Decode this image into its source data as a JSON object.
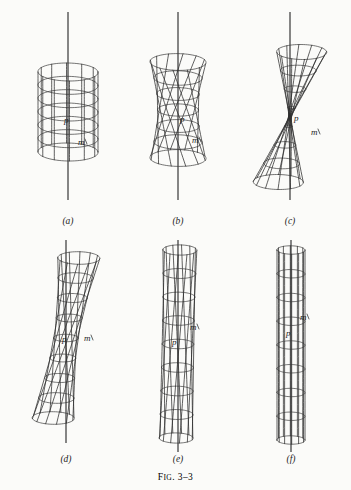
{
  "figure": {
    "caption_prefix": "F",
    "caption_smallcaps": "IG",
    "caption_suffix": ". 3–3",
    "caption_full": "FIG. 3–3",
    "background_color": "#fbfbf9",
    "ink_color": "#2b2b2b",
    "axis_color": "#2f2f2f"
  },
  "panels": [
    {
      "id": "a",
      "label": "(a)",
      "point_p": "p",
      "point_m": "m",
      "twist_turns": 0.0,
      "waist_radius": 30,
      "state": "hyperboloid of revolution, untwisted"
    },
    {
      "id": "b",
      "label": "(b)",
      "point_p": "p",
      "point_m": "m",
      "twist_turns": 0.22,
      "waist_radius": 27,
      "state": "slightly twisted"
    },
    {
      "id": "c",
      "label": "(c)",
      "point_p": "p",
      "point_m": "m",
      "twist_turns": 0.45,
      "waist_radius": 23,
      "state": "moderately twisted"
    },
    {
      "id": "d",
      "label": "(d)",
      "point_p": "p",
      "point_m": "m",
      "twist_turns": 0.68,
      "waist_radius": 18,
      "state": "strongly twisted"
    },
    {
      "id": "e",
      "label": "(e)",
      "point_p": "p",
      "point_m": "m",
      "twist_turns": 0.85,
      "waist_radius": 11,
      "state": "nearly collapsed, pinch nodes forming"
    },
    {
      "id": "f",
      "label": "(f)",
      "point_p": "p",
      "point_m": "m",
      "twist_turns": 1.0,
      "waist_radius": 4,
      "state": "fully collapsed into double cone"
    }
  ]
}
